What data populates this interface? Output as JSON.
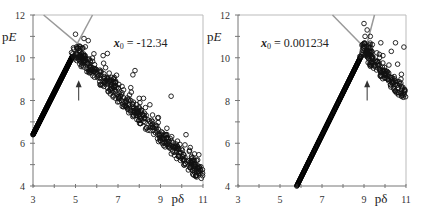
{
  "chart_data": [
    {
      "type": "scatter",
      "panel": "left",
      "xlabel": "pδ",
      "ylabel": "pE",
      "xlim": [
        3,
        11
      ],
      "ylim": [
        4,
        12
      ],
      "xticks": [
        "3",
        "5",
        "7",
        "9",
        "11"
      ],
      "yticks": [
        "4",
        "6",
        "8",
        "10",
        "12"
      ],
      "grid": false,
      "annotation": {
        "text_var": "x",
        "text_sub": "0",
        "text_rest": " = -12.34",
        "x": 6.8,
        "y": 10.5
      },
      "arrow": {
        "x": 5.15,
        "y_from": 8.0,
        "y_to": 8.9
      },
      "guide_lines": [
        {
          "x1": 3.5,
          "y1": 12,
          "x2": 5.3,
          "y2": 10.5
        },
        {
          "x1": 5.8,
          "y1": 12,
          "x2": 5.05,
          "y2": 10.6
        }
      ],
      "dense_line": {
        "x1": 3.0,
        "y1": 6.4,
        "x2": 4.85,
        "y2": 10.05
      },
      "peak": {
        "x": 5.1,
        "y": 10.2
      },
      "decay_band": {
        "x_start": 5.2,
        "y_start": 10.0,
        "x_end": 11.0,
        "y_end": 4.4,
        "spread": 0.35
      },
      "outliers": [
        [
          5.0,
          11.1
        ],
        [
          5.4,
          10.9
        ],
        [
          5.6,
          10.8
        ],
        [
          6.5,
          10.2
        ],
        [
          6.3,
          10.1
        ],
        [
          7.8,
          9.4
        ],
        [
          7.7,
          9.2
        ],
        [
          7.6,
          8.6
        ],
        [
          8.0,
          8.1
        ],
        [
          8.2,
          8.1
        ],
        [
          8.5,
          7.8
        ],
        [
          9.5,
          8.2
        ],
        [
          8.9,
          7.2
        ],
        [
          9.3,
          6.7
        ],
        [
          10.2,
          6.4
        ],
        [
          10.4,
          5.8
        ],
        [
          10.6,
          5.5
        ],
        [
          9.8,
          6.1
        ],
        [
          10.9,
          4.9
        ],
        [
          10.7,
          5.2
        ]
      ]
    },
    {
      "type": "scatter",
      "panel": "right",
      "xlabel": "pδ",
      "ylabel": "pE",
      "xlim": [
        3,
        11
      ],
      "ylim": [
        4,
        12
      ],
      "xticks": [
        "3",
        "5",
        "7",
        "9",
        "11"
      ],
      "yticks": [
        "4",
        "6",
        "8",
        "10",
        "12"
      ],
      "grid": false,
      "annotation": {
        "text_var": "x",
        "text_sub": "0",
        "text_rest": " = 0.001234",
        "x": 4.1,
        "y": 10.5
      },
      "arrow": {
        "x": 9.15,
        "y_from": 8.0,
        "y_to": 8.9
      },
      "guide_lines": [
        {
          "x1": 7.5,
          "y1": 12,
          "x2": 8.9,
          "y2": 10.6
        },
        {
          "x1": 9.5,
          "y1": 12,
          "x2": 9.1,
          "y2": 10.5
        }
      ],
      "dense_line": {
        "x1": 5.8,
        "y1": 4.0,
        "x2": 8.85,
        "y2": 10.05
      },
      "peak": {
        "x": 9.1,
        "y": 10.4
      },
      "decay_band": {
        "x_start": 9.1,
        "y_start": 10.1,
        "x_end": 11.0,
        "y_end": 8.2,
        "spread": 0.3
      },
      "outliers": [
        [
          9.0,
          11.6
        ],
        [
          9.15,
          11.3
        ],
        [
          9.8,
          10.7
        ],
        [
          10.5,
          10.7
        ],
        [
          10.9,
          10.5
        ],
        [
          10.3,
          10.3
        ],
        [
          9.9,
          10.1
        ],
        [
          10.6,
          9.7
        ],
        [
          9.05,
          11.0
        ],
        [
          9.3,
          11.0
        ]
      ]
    }
  ],
  "panels_px": [
    {
      "x0": 33,
      "x1": 203,
      "y0": 186,
      "y1": 15
    },
    {
      "x0": 238,
      "x1": 406,
      "y0": 186,
      "y1": 15
    }
  ]
}
